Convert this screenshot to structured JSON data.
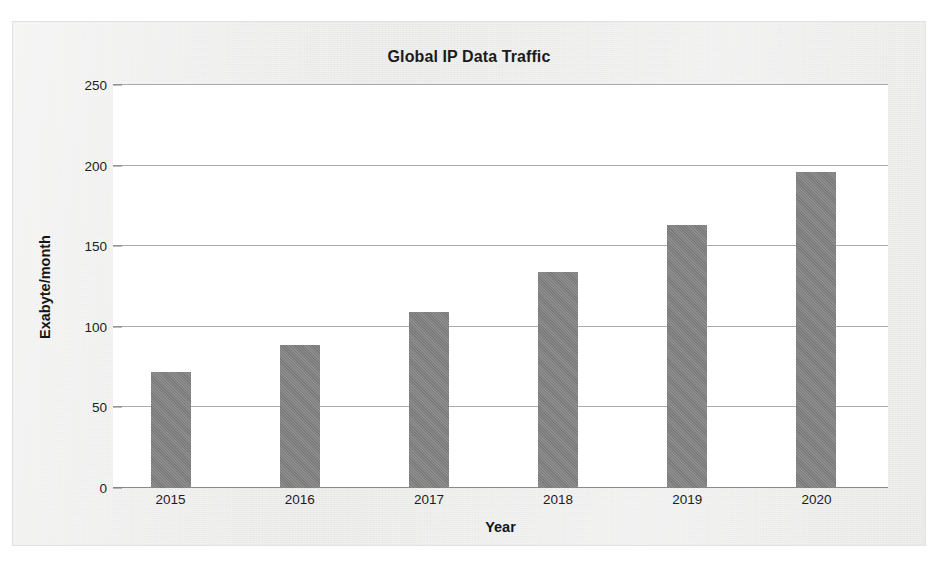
{
  "chart_data": {
    "type": "bar",
    "title": "Global IP Data Traffic",
    "xlabel": "Year",
    "ylabel": "Exabyte/month",
    "categories": [
      "2015",
      "2016",
      "2017",
      "2018",
      "2019",
      "2020"
    ],
    "values": [
      72,
      89,
      109,
      134,
      163,
      196
    ],
    "ylim": [
      0,
      250
    ],
    "ytick_step": 50,
    "yticks": [
      0,
      50,
      100,
      150,
      200,
      250
    ],
    "ytick_labels": [
      "0",
      "50",
      "100",
      "150",
      "200",
      "250"
    ],
    "grid": true,
    "legend": false,
    "legend_position": "none",
    "series": [
      {
        "name": "Global IP Data Traffic",
        "values": [
          72,
          89,
          109,
          134,
          163,
          196
        ]
      }
    ],
    "colors": {
      "bar_fill": "#818181",
      "gridline": "#8f8f8f",
      "plot_background": "#ffffff",
      "page_background": "#ececeb",
      "text": "#1b1b1b"
    }
  },
  "axis": {
    "y_labels": [
      "250",
      "200",
      "150",
      "100",
      "50",
      "0"
    ],
    "y_title": "Exabyte/month",
    "x_title": "Year",
    "x_labels": [
      "2015",
      "2016",
      "2017",
      "2018",
      "2019",
      "2020"
    ]
  },
  "header": {
    "title": "Global IP Data Traffic"
  }
}
